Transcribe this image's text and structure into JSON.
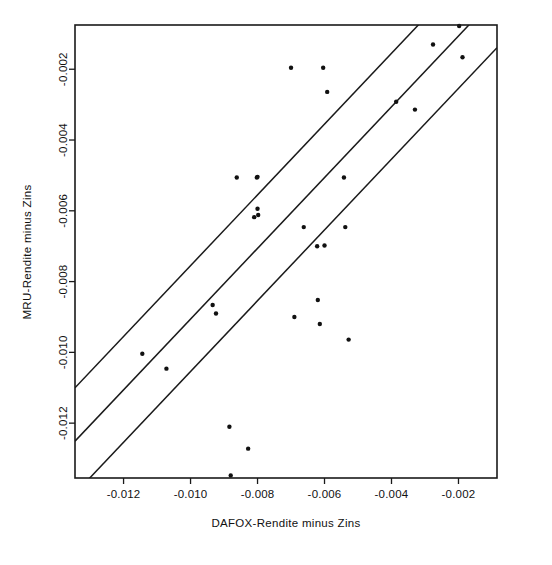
{
  "chart_data": {
    "type": "scatter",
    "title": "",
    "xlabel": "DAFOX-Rendite minus Zins",
    "ylabel": "MRU-Rendite minus Zins",
    "xlim": [
      -0.01345,
      -0.00085
    ],
    "ylim": [
      -0.01355,
      -0.00075
    ],
    "grid": false,
    "legend": null,
    "xticks": [
      -0.012,
      -0.01,
      -0.008,
      -0.006,
      -0.004,
      -0.002
    ],
    "xtick_labels": [
      "-0.012",
      "-0.010",
      "-0.008",
      "-0.006",
      "-0.004",
      "-0.002"
    ],
    "yticks": [
      -0.002,
      -0.004,
      -0.006,
      -0.008,
      -0.01,
      -0.012
    ],
    "ytick_labels": [
      "-0.002",
      "-0.004",
      "-0.006",
      "-0.008",
      "-0.010",
      "-0.012"
    ],
    "points": [
      {
        "x": -0.01144,
        "y": -0.01004
      },
      {
        "x": -0.01072,
        "y": -0.01046
      },
      {
        "x": -0.00934,
        "y": -0.00866
      },
      {
        "x": -0.00924,
        "y": -0.0089
      },
      {
        "x": -0.0088,
        "y": -0.01348
      },
      {
        "x": -0.00884,
        "y": -0.0121
      },
      {
        "x": -0.00862,
        "y": -0.00506
      },
      {
        "x": -0.00828,
        "y": -0.01272
      },
      {
        "x": -0.0081,
        "y": -0.00618
      },
      {
        "x": -0.00802,
        "y": -0.00506
      },
      {
        "x": -0.008,
        "y": -0.00504
      },
      {
        "x": -0.008,
        "y": -0.00594
      },
      {
        "x": -0.00798,
        "y": -0.00612
      },
      {
        "x": -0.007,
        "y": -0.00196
      },
      {
        "x": -0.0069,
        "y": -0.009
      },
      {
        "x": -0.00662,
        "y": -0.00646
      },
      {
        "x": -0.00622,
        "y": -0.007
      },
      {
        "x": -0.0062,
        "y": -0.00852
      },
      {
        "x": -0.00614,
        "y": -0.0092
      },
      {
        "x": -0.00604,
        "y": -0.00196
      },
      {
        "x": -0.006,
        "y": -0.00698
      },
      {
        "x": -0.00592,
        "y": -0.00264
      },
      {
        "x": -0.00542,
        "y": -0.00506
      },
      {
        "x": -0.00538,
        "y": -0.00646
      },
      {
        "x": -0.00528,
        "y": -0.00964
      },
      {
        "x": -0.00386,
        "y": -0.00292
      },
      {
        "x": -0.0033,
        "y": -0.00314
      },
      {
        "x": -0.00276,
        "y": -0.0013
      },
      {
        "x": -0.00198,
        "y": -0.00078
      },
      {
        "x": -0.00188,
        "y": -0.00166
      }
    ],
    "reference_lines": [
      {
        "name": "upper-band-line",
        "slope": 1.0,
        "intercept": 0.00245
      },
      {
        "name": "center-fit-line",
        "slope": 1.0,
        "intercept": 0.00094
      },
      {
        "name": "lower-band-line",
        "slope": 1.0,
        "intercept": -0.00054
      }
    ]
  }
}
